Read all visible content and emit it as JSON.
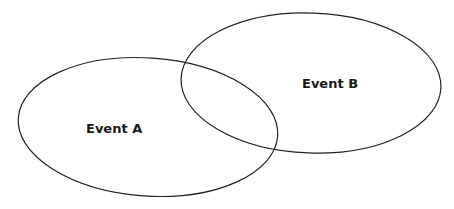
{
  "diagram": {
    "type": "venn",
    "sets": [
      {
        "label": "Event A",
        "cx": 148,
        "cy": 127,
        "rx": 130,
        "ry": 69
      },
      {
        "label": "Event B",
        "cx": 311,
        "cy": 83,
        "rx": 130,
        "ry": 70
      }
    ],
    "stroke_color": "#222222"
  }
}
